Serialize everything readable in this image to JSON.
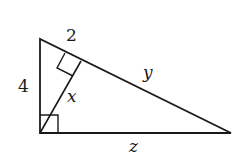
{
  "figure": {
    "type": "right-triangle-with-altitude",
    "stroke_color": "#1a1a1a",
    "vertices": {
      "top": [
        40,
        39
      ],
      "right_angle": [
        40,
        133
      ],
      "right": [
        231,
        133
      ],
      "altitude_foot": [
        81,
        61
      ]
    },
    "labels": {
      "left_leg": "4",
      "hypotenuse_top_segment": "2",
      "hypotenuse_bottom_segment": "y",
      "altitude": "x",
      "base": "z"
    }
  }
}
